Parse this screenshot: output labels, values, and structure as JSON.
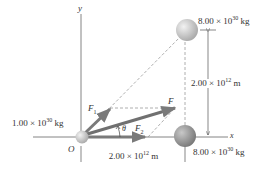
{
  "diagram": {
    "axes": {
      "x_label": "x",
      "y_label": "y",
      "origin_label": "O"
    },
    "masses": [
      {
        "id": "origin-mass",
        "value_mantissa": "1.00",
        "value_exp": "30",
        "unit": "kg",
        "position": "origin"
      },
      {
        "id": "top-mass",
        "value_mantissa": "8.00",
        "value_exp": "30",
        "unit": "kg",
        "position": "upper-right"
      },
      {
        "id": "right-mass",
        "value_mantissa": "8.00",
        "value_exp": "30",
        "unit": "kg",
        "position": "on x-axis"
      }
    ],
    "distances": [
      {
        "id": "horizontal",
        "mantissa": "2.00",
        "exp": "12",
        "unit": "m"
      },
      {
        "id": "vertical",
        "mantissa": "2.00",
        "exp": "12",
        "unit": "m"
      }
    ],
    "vectors": [
      {
        "id": "F1",
        "label": "F",
        "sub": "1"
      },
      {
        "id": "F2",
        "label": "F",
        "sub": "2"
      },
      {
        "id": "F",
        "label": "F",
        "sub": ""
      }
    ],
    "angle_label": "θ",
    "times_symbol": "×",
    "ten": "10",
    "colors": {
      "axis": "#555555",
      "vector": "#7a7a7a",
      "dashed": "#aaaaaa",
      "sphere_light": "#d8d8d8",
      "sphere_dark": "#8f8f8f",
      "text": "#333333"
    }
  }
}
